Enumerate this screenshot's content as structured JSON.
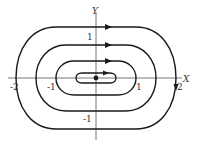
{
  "diagram": {
    "axes": {
      "x_label": "X",
      "y_label": "Y",
      "x_ticks": [
        {
          "label": "-2",
          "value": -2
        },
        {
          "label": "-1",
          "value": -1
        },
        {
          "label": "1",
          "value": 1
        },
        {
          "label": "2",
          "value": 2
        }
      ],
      "y_ticks": [
        {
          "label": "1",
          "value": 1
        },
        {
          "label": "-1",
          "value": -1
        }
      ]
    },
    "orbits": [
      {
        "name": "outer",
        "x_extent": [
          -2,
          2
        ],
        "y_extent": [
          -1.4,
          1.4
        ],
        "direction": "clockwise"
      },
      {
        "name": "second",
        "x_extent": [
          -1.5,
          1.5
        ],
        "y_extent": [
          -0.9,
          0.9
        ],
        "direction": "clockwise"
      },
      {
        "name": "third",
        "x_extent": [
          -1,
          1
        ],
        "y_extent": [
          -0.45,
          0.45
        ],
        "direction": "clockwise"
      },
      {
        "name": "inner",
        "x_extent": [
          -0.5,
          0.5
        ],
        "y_extent": [
          -0.15,
          0.15
        ],
        "direction": "clockwise"
      }
    ],
    "equilibrium": {
      "label": "origin",
      "x": 0,
      "y": 0
    },
    "colors": {
      "stroke": "#1a1a1a",
      "axis": "#555555",
      "text": "#333333"
    }
  }
}
